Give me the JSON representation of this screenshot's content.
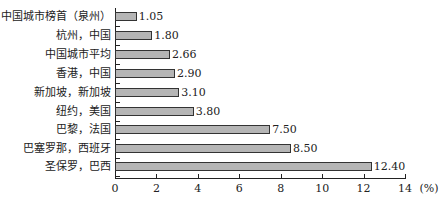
{
  "chart_data": {
    "type": "bar",
    "orientation": "horizontal",
    "title": "",
    "xlabel": "(%)",
    "ylabel": "",
    "xlim": [
      0,
      14
    ],
    "x_ticks": [
      "0",
      "2",
      "4",
      "6",
      "8",
      "10",
      "12",
      "14"
    ],
    "x_unit": "(%)",
    "grid": false,
    "legend": null,
    "bar_color": "#b5b5b5",
    "categories": [
      "中国城市榜首（泉州）",
      "杭州，中国",
      "中国城市平均",
      "香港，中国",
      "新加坡，新加坡",
      "纽约，美国",
      "巴黎，法国",
      "巴塞罗那，西班牙",
      "圣保罗，巴西"
    ],
    "values": [
      1.05,
      1.8,
      2.66,
      2.9,
      3.1,
      3.8,
      7.5,
      8.5,
      12.4
    ],
    "value_labels": [
      "1.05",
      "1.80",
      "2.66",
      "2.90",
      "3.10",
      "3.80",
      "7.50",
      "8.50",
      "12.40"
    ]
  }
}
